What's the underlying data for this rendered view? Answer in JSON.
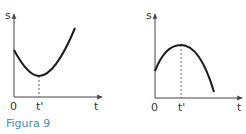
{
  "caption": "Figura 9",
  "colors": {
    "caption": "#3a8fc7",
    "axes": "#444444",
    "curve": "#1a1a1a",
    "dashed": "#666666"
  },
  "graphs": [
    {
      "id": "left",
      "y_label": "s",
      "x_label": "t",
      "origin_label": "0",
      "tick_label": "t'",
      "curve_shape": "minimum at t'"
    },
    {
      "id": "right",
      "y_label": "s",
      "x_label": "t",
      "origin_label": "0",
      "tick_label": "t'",
      "curve_shape": "maximum at t'"
    }
  ]
}
